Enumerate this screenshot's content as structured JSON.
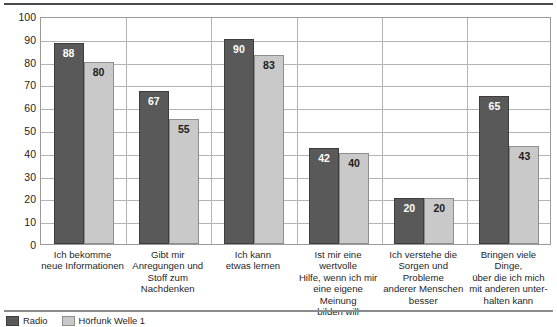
{
  "chart_data": {
    "type": "bar",
    "title": "",
    "subtitle": "",
    "xlabel": "",
    "ylabel": "",
    "ylim": [
      0,
      100
    ],
    "yticks": [
      0,
      10,
      20,
      30,
      40,
      50,
      60,
      70,
      80,
      90,
      100
    ],
    "grid": true,
    "legend_position": "bottom-left",
    "categories": [
      "Ich bekomme\nneue Informationen",
      "Gibt mir\nAnregungen und\nStoff zum\nNachdenken",
      "Ich kann\netwas lernen",
      "Ist mir eine wertvolle\nHilfe, wenn ich mir\neine eigene Meinung\nbilden will",
      "Ich verstehe die\nSorgen und Probleme\nanderer Menschen\nbesser",
      "Bringen viele Dinge,\nüber die ich mich\nmit anderen unter-\nhalten kann"
    ],
    "series": [
      {
        "name": "Serie 1",
        "color": "#595959",
        "values": [
          88,
          67,
          90,
          42,
          20,
          65
        ]
      },
      {
        "name": "Serie 2",
        "color": "#c9c9c9",
        "values": [
          80,
          55,
          83,
          40,
          20,
          43
        ]
      }
    ]
  },
  "axis": {
    "ytick_labels": [
      "100",
      "90",
      "80",
      "70",
      "60",
      "50",
      "40",
      "30",
      "20",
      "10",
      "0"
    ]
  },
  "categories_display": [
    [
      "Ich bekomme",
      "neue Informationen"
    ],
    [
      "Gibt mir",
      "Anregungen und",
      "Stoff zum",
      "Nachdenken"
    ],
    [
      "Ich kann",
      "etwas lernen"
    ],
    [
      "Ist mir eine wertvolle",
      "Hilfe, wenn ich mir",
      "eine eigene Meinung",
      "bilden will"
    ],
    [
      "Ich verstehe die",
      "Sorgen und Probleme",
      "anderer Menschen",
      "besser"
    ],
    [
      "Bringen viele Dinge,",
      "über die ich mich",
      "mit anderen unter-",
      "halten kann"
    ]
  ],
  "bar_labels": {
    "series0": [
      "88",
      "67",
      "90",
      "42",
      "20",
      "65"
    ],
    "series1": [
      "80",
      "55",
      "83",
      "40",
      "20",
      "43"
    ]
  },
  "legend": {
    "items": [
      {
        "label": "Radio",
        "color": "#595959"
      },
      {
        "label": "Hörfunk Welle 1",
        "color": "#c9c9c9"
      }
    ]
  },
  "colors": {
    "series0": "#595959",
    "series1": "#c9c9c9",
    "grid": "#b4b4b4",
    "frame": "#9a9a9a",
    "top_rule": "#4a4a4a"
  }
}
